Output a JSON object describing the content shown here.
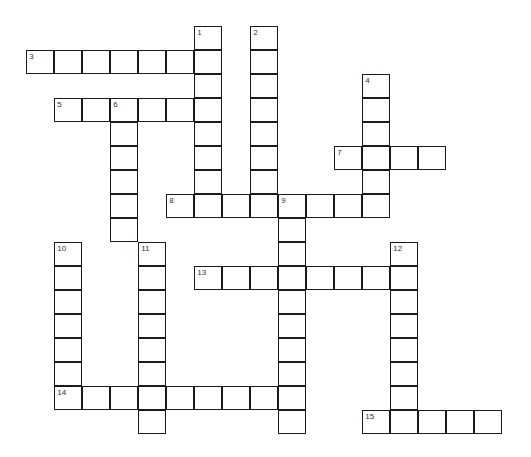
{
  "puzzle": {
    "type": "crossword",
    "colors": {
      "border": "#1a1a1a",
      "cell": "#ffffff",
      "number": "#333333"
    },
    "words": [
      {
        "number": "1",
        "direction": "down",
        "row": 0,
        "col": 6,
        "length": 8
      },
      {
        "number": "2",
        "direction": "down",
        "row": 0,
        "col": 8,
        "length": 8
      },
      {
        "number": "3",
        "direction": "across",
        "row": 1,
        "col": 0,
        "length": 7
      },
      {
        "number": "4",
        "direction": "down",
        "row": 2,
        "col": 12,
        "length": 6
      },
      {
        "number": "5",
        "direction": "across",
        "row": 3,
        "col": 1,
        "length": 6
      },
      {
        "number": "6",
        "direction": "down",
        "row": 3,
        "col": 3,
        "length": 6
      },
      {
        "number": "7",
        "direction": "across",
        "row": 5,
        "col": 11,
        "length": 4
      },
      {
        "number": "8",
        "direction": "across",
        "row": 7,
        "col": 5,
        "length": 8
      },
      {
        "number": "9",
        "direction": "down",
        "row": 7,
        "col": 9,
        "length": 10
      },
      {
        "number": "10",
        "direction": "down",
        "row": 9,
        "col": 1,
        "length": 7
      },
      {
        "number": "11",
        "direction": "down",
        "row": 9,
        "col": 4,
        "length": 8
      },
      {
        "number": "12",
        "direction": "down",
        "row": 9,
        "col": 13,
        "length": 8
      },
      {
        "number": "13",
        "direction": "across",
        "row": 10,
        "col": 6,
        "length": 8
      },
      {
        "number": "14",
        "direction": "across",
        "row": 15,
        "col": 1,
        "length": 9
      },
      {
        "number": "15",
        "direction": "across",
        "row": 16,
        "col": 12,
        "length": 5
      }
    ]
  }
}
